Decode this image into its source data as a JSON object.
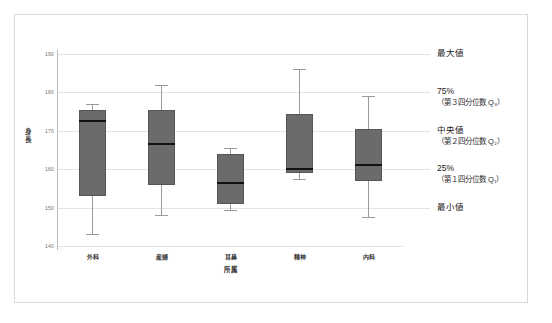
{
  "chart_data": {
    "type": "box",
    "title": "",
    "xlabel": "所属",
    "ylabel": "身長",
    "categories": [
      "外科",
      "産婦",
      "耳鼻",
      "精神",
      "内科"
    ],
    "ylim": [
      140,
      190
    ],
    "yticks": [
      140,
      150,
      160,
      170,
      180,
      190
    ],
    "grid": true,
    "legend": "none",
    "box_color": "#6b6b6b",
    "median_color": "#111111",
    "whisker_color": "#9a9a9a",
    "series": [
      {
        "name": "外科",
        "min": 143.0,
        "q1": 153.0,
        "median": 172.5,
        "q3": 175.5,
        "max": 177.0
      },
      {
        "name": "産婦",
        "min": 148.0,
        "q1": 156.0,
        "median": 166.5,
        "q3": 175.5,
        "max": 182.0
      },
      {
        "name": "耳鼻",
        "min": 149.5,
        "q1": 151.0,
        "median": 156.5,
        "q3": 164.0,
        "max": 165.5
      },
      {
        "name": "精神",
        "min": 157.5,
        "q1": 159.0,
        "median": 160.0,
        "q3": 174.5,
        "max": 186.0
      },
      {
        "name": "内科",
        "min": 147.5,
        "q1": 157.0,
        "median": 161.0,
        "q3": 170.5,
        "max": 179.0
      }
    ],
    "annotations": [
      {
        "value": 190,
        "main": "最大値",
        "sub": ""
      },
      {
        "value": 180,
        "main": "75%",
        "sub": "（第３四分位数 Q₃）"
      },
      {
        "value": 170,
        "main": "中央値",
        "sub": "（第２四分位数 Q₂）"
      },
      {
        "value": 160,
        "main": "25%",
        "sub": "（第１四分位数 Q₁）"
      },
      {
        "value": 150,
        "main": "最小値",
        "sub": ""
      }
    ]
  }
}
